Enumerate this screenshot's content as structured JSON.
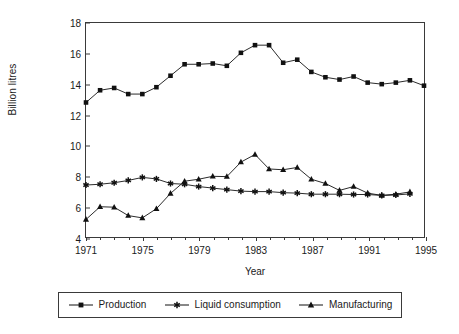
{
  "chart_data": {
    "type": "line",
    "title": "",
    "xlabel": "Year",
    "ylabel": "Billion litres",
    "xlim": [
      1971,
      1995
    ],
    "ylim": [
      4,
      18
    ],
    "grid": false,
    "legend_position": "bottom",
    "x_tick_labels": [
      "1971",
      "1975",
      "1979",
      "1983",
      "1987",
      "1991",
      "1995"
    ],
    "x_tick_values": [
      1971,
      1975,
      1979,
      1983,
      1987,
      1991,
      1995
    ],
    "x_minor_tick_values": [
      1972,
      1973,
      1974,
      1976,
      1977,
      1978,
      1980,
      1981,
      1982,
      1984,
      1985,
      1986,
      1988,
      1989,
      1990,
      1992,
      1993,
      1994
    ],
    "y_tick_labels": [
      "4",
      "6",
      "8",
      "10",
      "12",
      "14",
      "16",
      "18"
    ],
    "y_tick_values": [
      4,
      6,
      8,
      10,
      12,
      14,
      16,
      18
    ],
    "x": [
      1971,
      1972,
      1973,
      1974,
      1975,
      1976,
      1977,
      1978,
      1979,
      1980,
      1981,
      1982,
      1983,
      1984,
      1985,
      1986,
      1987,
      1988,
      1989,
      1990,
      1991,
      1992,
      1993,
      1994
    ],
    "series": [
      {
        "name": "Production",
        "marker": "square",
        "color": "#111111",
        "values": [
          12.8,
          13.6,
          13.75,
          13.35,
          13.35,
          13.8,
          14.55,
          15.3,
          15.3,
          15.35,
          15.2,
          16.05,
          16.55,
          16.55,
          15.4,
          15.6,
          14.8,
          14.45,
          14.3,
          14.5,
          14.1,
          14.0,
          14.1,
          14.25
        ]
      },
      {
        "name": "Liquid consumption",
        "marker": "asterisk",
        "color": "#111111",
        "values": [
          7.4,
          7.45,
          7.55,
          7.7,
          7.9,
          7.8,
          7.5,
          7.45,
          7.3,
          7.2,
          7.1,
          7.0,
          6.97,
          6.97,
          6.9,
          6.87,
          6.8,
          6.8,
          6.8,
          6.78,
          6.78,
          6.72,
          6.75,
          6.82
        ]
      },
      {
        "name": "Manufacturing",
        "marker": "triangle",
        "color": "#111111",
        "values": [
          5.15,
          5.98,
          5.95,
          5.4,
          5.25,
          5.85,
          6.85,
          7.65,
          7.78,
          7.97,
          7.95,
          8.9,
          9.4,
          8.45,
          8.4,
          8.55,
          7.78,
          7.5,
          7.05,
          7.3,
          6.87,
          6.72,
          6.8,
          6.95
        ]
      }
    ],
    "extra_points": {
      "production_end": {
        "x": 1995,
        "y": 13.9
      }
    }
  }
}
